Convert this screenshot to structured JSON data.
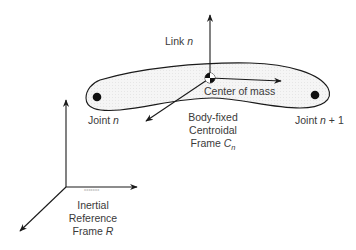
{
  "diagram": {
    "labels": {
      "link": {
        "text": "Link ",
        "var": "n"
      },
      "center_of_mass": "Center of mass",
      "joint_n": {
        "text": "Joint ",
        "var": "n"
      },
      "joint_n1": {
        "text": "Joint ",
        "var": "n",
        "suffix": " + 1"
      },
      "body_frame": {
        "line1": "Body-fixed",
        "line2": "Centroidal",
        "line3": "Frame ",
        "var": "C",
        "sub": "n"
      },
      "inertial_frame": {
        "line1": "Inertial",
        "line2": "Reference",
        "line3": "Frame ",
        "var": "R"
      }
    },
    "colors": {
      "stroke": "#1a1a1a",
      "link_fill": "#f3f3f3",
      "text": "#3a3a3a",
      "background": "#ffffff"
    }
  }
}
